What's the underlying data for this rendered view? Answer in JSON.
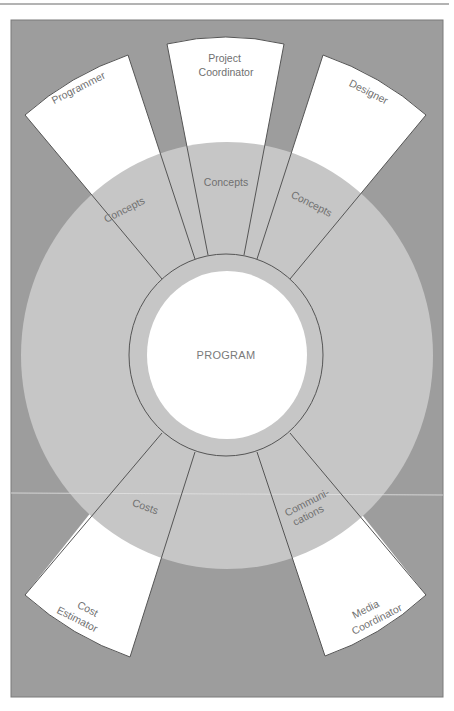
{
  "diagram": {
    "center_label": "PROGRAM",
    "roles": [
      {
        "id": "programmer",
        "label_lines": [
          "Programmer"
        ],
        "link_label_lines": [
          "Concepts"
        ]
      },
      {
        "id": "project-coordinator",
        "label_lines": [
          "Project",
          "Coordinator"
        ],
        "link_label_lines": [
          "Concepts"
        ]
      },
      {
        "id": "designer",
        "label_lines": [
          "Designer"
        ],
        "link_label_lines": [
          "Concepts"
        ]
      },
      {
        "id": "cost-estimator",
        "label_lines": [
          "Cost",
          "Estimator"
        ],
        "link_label_lines": [
          "Costs"
        ]
      },
      {
        "id": "media-coordinator",
        "label_lines": [
          "Media",
          "Coordinator"
        ],
        "link_label_lines": [
          "Communi-",
          "cations"
        ]
      }
    ]
  },
  "colors": {
    "page": "#ffffff",
    "frame_fill": "#9d9d9d",
    "frame_stroke": "#7a7a7a",
    "outer_circle": "#c6c6c6",
    "wedge_fill": "#ffffff",
    "line": "#555555",
    "text": "#707070",
    "top_rule": "#9a9a9a"
  }
}
